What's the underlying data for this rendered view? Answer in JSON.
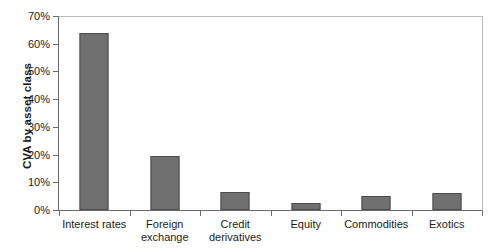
{
  "chart_data": {
    "type": "bar",
    "title": "",
    "xlabel": "",
    "ylabel": "CVA by asset class",
    "categories": [
      "Interest rates",
      "Foreign exchange",
      "Credit derivatives",
      "Equity",
      "Commodities",
      "Exotics"
    ],
    "category_lines": [
      [
        "Interest rates"
      ],
      [
        "Foreign",
        "exchange"
      ],
      [
        "Credit",
        "derivatives"
      ],
      [
        "Equity"
      ],
      [
        "Commodities"
      ],
      [
        "Exotics"
      ]
    ],
    "values": [
      64,
      19.5,
      6.5,
      2.5,
      5,
      6
    ],
    "value_labels": [
      "64%",
      "19.5%",
      "6.5%",
      "2.5%",
      "5%",
      "6%"
    ],
    "ylim": [
      0,
      70
    ],
    "ytick_values": [
      70,
      60,
      50,
      40,
      30,
      20,
      10,
      0
    ],
    "ytick_labels": [
      "70%",
      "60%",
      "50%",
      "40%",
      "30%",
      "20%",
      "10%",
      "0%"
    ],
    "grid": false,
    "legend": "none",
    "units": "percent",
    "bar_color": "#707070",
    "bar_border_color": "#4d4d4d",
    "axis_color": "#6a6a6a",
    "frame_color": "#b9b9b9",
    "background_color": "#ffffff"
  }
}
